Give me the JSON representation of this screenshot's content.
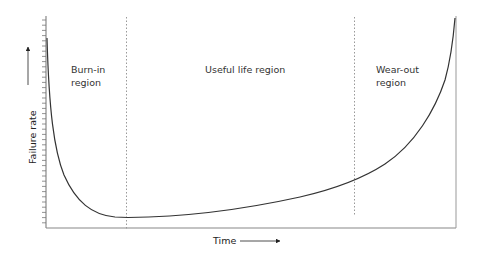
{
  "chart_data": {
    "type": "line",
    "title": "",
    "xlabel": "Time",
    "ylabel": "Failure rate",
    "grid": false,
    "legend": null,
    "x_ticks": [],
    "y_ticks": "unlabeled minor ticks along y-axis",
    "regions": [
      {
        "label": "Burn-in region",
        "line1": "Burn-in",
        "line2": "region",
        "x_start": 0,
        "x_end": 0.2
      },
      {
        "label": "Useful life region",
        "line1": "Useful life region",
        "x_start": 0.2,
        "x_end": 0.75
      },
      {
        "label": "Wear-out region",
        "line1": "Wear-out",
        "line2": "region",
        "x_start": 0.75,
        "x_end": 1.0
      }
    ],
    "boundaries": [
      0.2,
      0.75
    ],
    "series": [
      {
        "name": "Failure rate (bathtub curve)",
        "x": [
          0.0,
          0.01,
          0.03,
          0.06,
          0.1,
          0.15,
          0.2,
          0.3,
          0.4,
          0.5,
          0.6,
          0.7,
          0.75,
          0.8,
          0.85,
          0.9,
          0.95,
          0.98,
          1.0
        ],
        "y": [
          1.0,
          0.82,
          0.55,
          0.33,
          0.17,
          0.07,
          0.05,
          0.055,
          0.07,
          0.1,
          0.14,
          0.2,
          0.23,
          0.28,
          0.35,
          0.45,
          0.62,
          0.82,
          1.0
        ]
      }
    ]
  },
  "labels": {
    "y_axis": "Failure rate",
    "x_axis": "Time",
    "burn_in_1": "Burn-in",
    "burn_in_2": "region",
    "useful": "Useful life region",
    "wear_1": "Wear-out",
    "wear_2": "region"
  }
}
